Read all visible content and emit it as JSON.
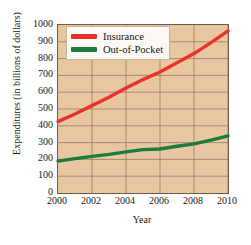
{
  "chart_data": {
    "type": "line",
    "title": "",
    "xlabel": "Year",
    "ylabel": "Expenditures (in billions of dollars)",
    "x": [
      2000,
      2001,
      2002,
      2003,
      2004,
      2005,
      2006,
      2007,
      2008,
      2009,
      2010
    ],
    "xlim": [
      2000,
      2010
    ],
    "ylim": [
      0,
      1000
    ],
    "xticks": [
      2000,
      2002,
      2004,
      2006,
      2008,
      2010
    ],
    "yticks": [
      0,
      100,
      200,
      300,
      400,
      500,
      600,
      700,
      800,
      900,
      1000
    ],
    "grid": true,
    "legend_position": "upper left",
    "series": [
      {
        "name": "Insurance",
        "color": "#e8332a",
        "values": [
          425,
          470,
          520,
          570,
          625,
          675,
          720,
          775,
          830,
          895,
          965
        ]
      },
      {
        "name": "Out-of-Pocket",
        "color": "#1b7a3d",
        "values": [
          190,
          205,
          218,
          230,
          245,
          258,
          262,
          278,
          292,
          315,
          340
        ]
      }
    ]
  },
  "axes": {
    "y_tick_labels": [
      "1000",
      "900",
      "800",
      "700",
      "600",
      "500",
      "400",
      "300",
      "200",
      "100",
      "0"
    ],
    "x_tick_labels": [
      "2000",
      "2002",
      "2004",
      "2006",
      "2008",
      "2010"
    ],
    "x_title": "Year",
    "y_title": "Expenditures (in billions of dollars)"
  },
  "legend": {
    "entries": [
      {
        "label": "Insurance",
        "color": "#e8332a"
      },
      {
        "label": "Out-of-Pocket",
        "color": "#1b7a3d"
      }
    ]
  },
  "colors": {
    "plot_background": "#e9c6a2",
    "grid": "#8a7158",
    "axis": "#6e5a47",
    "insurance": "#e8332a",
    "out_of_pocket": "#1b7a3d",
    "legend_background": "#fdfaf6",
    "page_background": "#ffffff"
  }
}
